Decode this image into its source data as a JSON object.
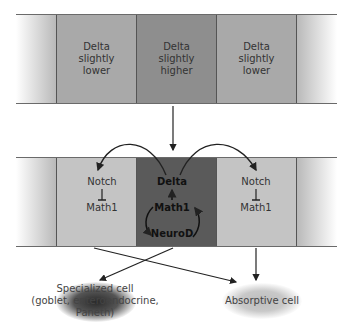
{
  "top_row": {
    "cells": [
      {
        "label": "Delta slightly lower",
        "lines": [
          "Delta",
          "slightly",
          "lower"
        ],
        "color": "#a9a9a9"
      },
      {
        "label": "Delta slightly higher",
        "lines": [
          "Delta",
          "slightly",
          "higher"
        ],
        "color": "#8e8e8e"
      },
      {
        "label": "Delta slightly lower",
        "lines": [
          "Delta",
          "slightly",
          "lower"
        ],
        "color": "#a9a9a9"
      }
    ]
  },
  "bottom_row": {
    "left": {
      "notch": "Notch",
      "math1": "Math1",
      "color": "#c4c4c4"
    },
    "center": {
      "delta": "Delta",
      "math1": "Math1",
      "neurod": "NeuroD",
      "color": "#5a5a5a"
    },
    "right": {
      "notch": "Notch",
      "math1": "Math1",
      "color": "#c4c4c4"
    }
  },
  "outcomes": {
    "specialized": {
      "line1": "Specialized cell",
      "line2": "(goblet, enteroendocrine,",
      "line3": "Paneth)"
    },
    "absorptive": {
      "label": "Absorptive cell"
    }
  }
}
